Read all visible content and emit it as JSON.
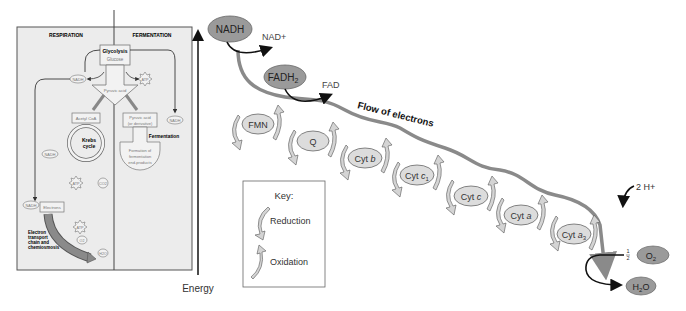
{
  "overview_panel": {
    "left_header": "RESPIRATION",
    "right_header": "FERMENTATION",
    "glycolysis": "Glycolysis",
    "glucose": "Glucose",
    "nadh": "NADH",
    "atp": "ATP",
    "pyruvic_acid": "Pyruvic acid",
    "acetyl_coa": "Acetyl CoA",
    "kreb_line1": "Krebs",
    "kreb_line2": "cycle",
    "co2": "CO2",
    "pyruvic_deriv_line1": "Pyruvic acid",
    "pyruvic_deriv_line2": "(or derivative)",
    "fermentation": "Fermentation",
    "formation_line1": "Formation of",
    "formation_line2": "fermentation",
    "formation_line3": "end-products",
    "electrons": "Electrons",
    "etc_line1": "Electron",
    "etc_line2": "transport",
    "etc_line3": "chain and",
    "etc_line4": "chemiosmosis",
    "o2": "O2",
    "h2o": "H2O"
  },
  "energy_axis": {
    "label": "Energy"
  },
  "chain": {
    "nadh": "NADH",
    "nad_plus": "NAD+",
    "fadh2": "FADH",
    "fadh2_sub": "2",
    "fad": "FAD",
    "flow_label": "Flow of electrons",
    "carriers": [
      {
        "name": "FMN",
        "main": "FMN",
        "italic": "",
        "sub": ""
      },
      {
        "name": "Q",
        "main": "Q",
        "italic": "",
        "sub": ""
      },
      {
        "name": "Cyt b",
        "main": "Cyt ",
        "italic": "b",
        "sub": ""
      },
      {
        "name": "Cyt c1",
        "main": "Cyt ",
        "italic": "c",
        "sub": "1"
      },
      {
        "name": "Cyt c",
        "main": "Cyt ",
        "italic": "c",
        "sub": ""
      },
      {
        "name": "Cyt a",
        "main": "Cyt ",
        "italic": "a",
        "sub": ""
      },
      {
        "name": "Cyt a3",
        "main": "Cyt ",
        "italic": "a",
        "sub": "3"
      }
    ],
    "protons": "2 H+",
    "half": "1/2",
    "o2": "O",
    "o2_sub": "2",
    "h2o_h": "H",
    "h2o_sub": "2",
    "h2o_o": "O"
  },
  "key": {
    "title": "Key:",
    "reduction": "Reduction",
    "oxidation": "Oxidation"
  },
  "colors": {
    "panel_bg": "#ececec",
    "carrier_fill": "#dcdcdc",
    "dark_carrier_fill": "#9a9a9a",
    "flow_line": "#8a8a8a",
    "arrow_fill": "#d4d4d4"
  }
}
